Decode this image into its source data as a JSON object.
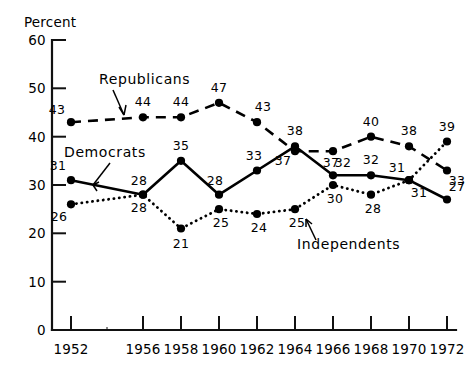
{
  "chart_data": {
    "type": "line",
    "title": "",
    "xlabel": "",
    "ylabel": "Percent",
    "ylim": [
      0,
      60
    ],
    "yticks": [
      0,
      10,
      20,
      30,
      40,
      50,
      60
    ],
    "grid": false,
    "legend_position": "inline-annotations",
    "categories": [
      "1952",
      "1956",
      "1958",
      "1960",
      "1962",
      "1964",
      "1966",
      "1968",
      "1970",
      "1972"
    ],
    "x": [
      1952,
      1956,
      1958,
      1960,
      1962,
      1964,
      1966,
      1968,
      1970,
      1972
    ],
    "series": [
      {
        "name": "Republicans",
        "style": "dashed",
        "values": [
          43,
          44,
          44,
          47,
          43,
          37,
          37,
          40,
          38,
          33
        ]
      },
      {
        "name": "Democrats",
        "style": "solid",
        "values": [
          31,
          28,
          35,
          28,
          33,
          38,
          32,
          32,
          31,
          27
        ]
      },
      {
        "name": "Independents",
        "style": "dotted",
        "values": [
          26,
          28,
          21,
          25,
          24,
          25,
          30,
          28,
          31,
          39
        ]
      }
    ],
    "annotations": [
      {
        "text": "Republicans",
        "points_to": "republicans-line"
      },
      {
        "text": "Democrats",
        "points_to": "democrats-line"
      },
      {
        "text": "Independents",
        "points_to": "independents-line"
      }
    ]
  },
  "axis": {
    "y_title": "Percent",
    "y_ticks": [
      "60",
      "50",
      "40",
      "30",
      "20",
      "10",
      "0"
    ],
    "x_ticks": [
      "1952",
      "1956",
      "1958",
      "1960",
      "1962",
      "1964",
      "1966",
      "1968",
      "1970",
      "1972"
    ]
  },
  "labels": {
    "republicans": "Republicans",
    "democrats": "Democrats",
    "independents": "Independents",
    "rep": [
      "43",
      "44",
      "44",
      "47",
      "43",
      "37",
      "37",
      "40",
      "38",
      "33"
    ],
    "dem": [
      "31",
      "28",
      "35",
      "28",
      "33",
      "38",
      "32",
      "32",
      "31",
      "27"
    ],
    "ind": [
      "26",
      "28",
      "21",
      "25",
      "24",
      "25",
      "30",
      "28",
      "31",
      "39"
    ]
  }
}
